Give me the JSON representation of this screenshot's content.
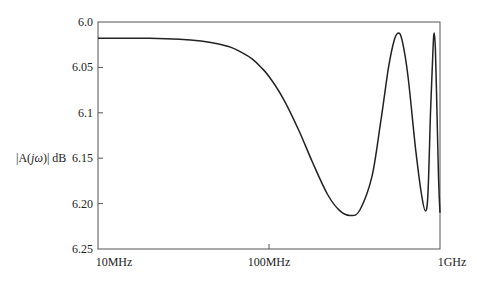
{
  "chart_data": {
    "type": "line",
    "title": "",
    "xlabel": "",
    "ylabel": "|A(jω)| dB",
    "ylabel_parts": {
      "pre": "|A(",
      "italic": "jω",
      "post": ")| dB"
    },
    "x_scale": "log",
    "xlim_hz": [
      10000000,
      1000000000
    ],
    "x_ticks": [
      {
        "label": "10MHz",
        "value": 10000000
      },
      {
        "label": "100MHz",
        "value": 100000000
      },
      {
        "label": "1GHz",
        "value": 1000000000
      }
    ],
    "ylim": [
      6.0,
      6.25
    ],
    "y_inverted": true,
    "y_ticks": [
      {
        "label": "6.0",
        "value": 6.0
      },
      {
        "label": "6.05",
        "value": 6.05
      },
      {
        "label": "6.1",
        "value": 6.1
      },
      {
        "label": "6.15",
        "value": 6.15
      },
      {
        "label": "6.20",
        "value": 6.2
      },
      {
        "label": "6.25",
        "value": 6.25
      }
    ],
    "grid": false,
    "legend": null,
    "series": [
      {
        "name": "|A(jω)|",
        "color": "#222222",
        "points": [
          {
            "f_mhz": 10,
            "db": 6.018
          },
          {
            "f_mhz": 20,
            "db": 6.018
          },
          {
            "f_mhz": 30,
            "db": 6.019
          },
          {
            "f_mhz": 40,
            "db": 6.021
          },
          {
            "f_mhz": 50,
            "db": 6.024
          },
          {
            "f_mhz": 60,
            "db": 6.028
          },
          {
            "f_mhz": 70,
            "db": 6.034
          },
          {
            "f_mhz": 80,
            "db": 6.041
          },
          {
            "f_mhz": 90,
            "db": 6.05
          },
          {
            "f_mhz": 100,
            "db": 6.06
          },
          {
            "f_mhz": 120,
            "db": 6.083
          },
          {
            "f_mhz": 150,
            "db": 6.12
          },
          {
            "f_mhz": 180,
            "db": 6.155
          },
          {
            "f_mhz": 220,
            "db": 6.19
          },
          {
            "f_mhz": 260,
            "db": 6.208
          },
          {
            "f_mhz": 300,
            "db": 6.213
          },
          {
            "f_mhz": 340,
            "db": 6.207
          },
          {
            "f_mhz": 400,
            "db": 6.17
          },
          {
            "f_mhz": 450,
            "db": 6.11
          },
          {
            "f_mhz": 500,
            "db": 6.05
          },
          {
            "f_mhz": 540,
            "db": 6.02
          },
          {
            "f_mhz": 570,
            "db": 6.012
          },
          {
            "f_mhz": 600,
            "db": 6.02
          },
          {
            "f_mhz": 650,
            "db": 6.06
          },
          {
            "f_mhz": 720,
            "db": 6.14
          },
          {
            "f_mhz": 780,
            "db": 6.19
          },
          {
            "f_mhz": 820,
            "db": 6.208
          },
          {
            "f_mhz": 850,
            "db": 6.19
          },
          {
            "f_mhz": 880,
            "db": 6.1
          },
          {
            "f_mhz": 910,
            "db": 6.03
          },
          {
            "f_mhz": 925,
            "db": 6.012
          },
          {
            "f_mhz": 940,
            "db": 6.03
          },
          {
            "f_mhz": 960,
            "db": 6.1
          },
          {
            "f_mhz": 980,
            "db": 6.17
          },
          {
            "f_mhz": 1000,
            "db": 6.21
          }
        ]
      }
    ]
  },
  "plot_area": {
    "left": 98,
    "top": 22,
    "right": 440,
    "bottom": 249
  }
}
